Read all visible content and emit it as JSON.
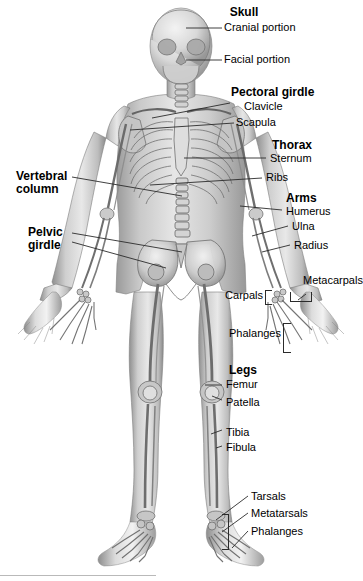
{
  "figure": {
    "view": "anterior",
    "background_color": "#ffffff",
    "line_color": "#2b2b2b",
    "art_style": "grayscale pencil-shaded anatomical illustration"
  },
  "labels": {
    "skull": "Skull",
    "cranial_portion": "Cranial portion",
    "facial_portion": "Facial portion",
    "pectoral_girdle": "Pectoral girdle",
    "clavicle": "Clavicle",
    "scapula": "Scapula",
    "thorax": "Thorax",
    "sternum": "Sternum",
    "ribs": "Ribs",
    "arms": "Arms",
    "humerus": "Humerus",
    "ulna": "Ulna",
    "radius": "Radius",
    "metacarpals": "Metacarpals",
    "carpals": "Carpals",
    "phalanges_hand": "Phalanges",
    "vertebral_column": "Vertebral\ncolumn",
    "pelvic_girdle": "Pelvic\ngirdle",
    "legs": "Legs",
    "femur": "Femur",
    "patella": "Patella",
    "tibia": "Tibia",
    "fibula": "Fibula",
    "tarsals": "Tarsals",
    "metatarsals": "Metatarsals",
    "phalanges_foot": "Phalanges"
  }
}
